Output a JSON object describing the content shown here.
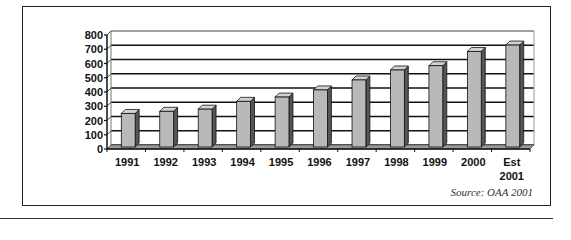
{
  "chart_data": {
    "type": "bar",
    "style": "3d-column",
    "title": "",
    "xlabel": "",
    "ylabel": "",
    "categories": [
      "1991",
      "1992",
      "1993",
      "1994",
      "1995",
      "1996",
      "1997",
      "1998",
      "1999",
      "2000",
      "Est 2001"
    ],
    "category_lines": [
      [
        "1991"
      ],
      [
        "1992"
      ],
      [
        "1993"
      ],
      [
        "1994"
      ],
      [
        "1995"
      ],
      [
        "1996"
      ],
      [
        "1997"
      ],
      [
        "1998"
      ],
      [
        "1999"
      ],
      [
        "2000"
      ],
      [
        "Est",
        "2001"
      ]
    ],
    "values": [
      260,
      275,
      290,
      345,
      375,
      425,
      495,
      565,
      595,
      695,
      740
    ],
    "ylim": [
      0,
      800
    ],
    "yticks": [
      0,
      100,
      200,
      300,
      400,
      500,
      600,
      700,
      800
    ],
    "grid": true,
    "legend": null,
    "source": "Source: OAA 2001",
    "colors": {
      "bar_front": "#b9b9b9",
      "bar_side": "#555555",
      "bar_top": "#d2d2d2",
      "floor": "#9a9a9a",
      "grid": "#111111"
    }
  },
  "caption": {
    "source": "Source: OAA 2001"
  }
}
